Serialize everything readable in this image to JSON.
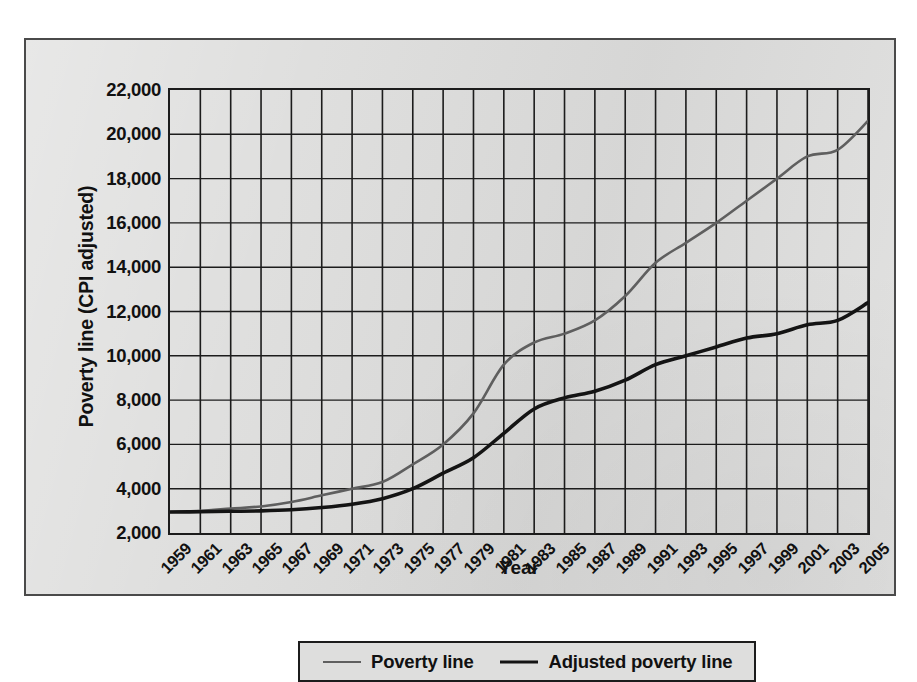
{
  "axes": {
    "ylabel": "Poverty line (CPI adjusted)",
    "xlabel": "Year"
  },
  "legend": {
    "items": [
      {
        "label": "Poverty line",
        "color": "#5f5f5f",
        "width": 2.0
      },
      {
        "label": "Adjusted poverty line",
        "color": "#141414",
        "width": 3.2
      }
    ]
  },
  "chart_data": {
    "type": "line",
    "title": "",
    "xlabel": "Year",
    "ylabel": "Poverty line (CPI adjusted)",
    "xlim": [
      1959,
      2005
    ],
    "ylim": [
      2000,
      22000
    ],
    "ytick_labels": [
      "2,000",
      "4,000",
      "6,000",
      "8,000",
      "10,000",
      "12,000",
      "14,000",
      "16,000",
      "18,000",
      "20,000",
      "22,000"
    ],
    "yticks": [
      2000,
      4000,
      6000,
      8000,
      10000,
      12000,
      14000,
      16000,
      18000,
      20000,
      22000
    ],
    "xtick_labels": [
      "1959",
      "1961",
      "1963",
      "1965",
      "1967",
      "1969",
      "1971",
      "1973",
      "1975",
      "1977",
      "1979",
      "1981",
      "1983",
      "1985",
      "1987",
      "1989",
      "1991",
      "1993",
      "1995",
      "1997",
      "1999",
      "2001",
      "2003",
      "2005"
    ],
    "xticks": [
      1959,
      1961,
      1963,
      1965,
      1967,
      1969,
      1971,
      1973,
      1975,
      1977,
      1979,
      1981,
      1983,
      1985,
      1987,
      1989,
      1991,
      1993,
      1995,
      1997,
      1999,
      2001,
      2003,
      2005
    ],
    "grid": true,
    "legend_position": "below",
    "x": [
      1959,
      1961,
      1963,
      1965,
      1967,
      1969,
      1971,
      1973,
      1975,
      1977,
      1979,
      1981,
      1983,
      1985,
      1987,
      1989,
      1991,
      1993,
      1995,
      1997,
      1999,
      2001,
      2003,
      2005
    ],
    "series": [
      {
        "name": "Poverty line",
        "color": "#5f5f5f",
        "values": [
          2950,
          3000,
          3100,
          3200,
          3400,
          3700,
          4000,
          4300,
          5100,
          6000,
          7400,
          9600,
          10600,
          11000,
          11600,
          12700,
          14200,
          15100,
          16000,
          17000,
          18000,
          19000,
          19300,
          20600
        ]
      },
      {
        "name": "Adjusted poverty line",
        "color": "#141414",
        "values": [
          2950,
          2960,
          2980,
          3000,
          3050,
          3150,
          3300,
          3550,
          4000,
          4700,
          5400,
          6500,
          7600,
          8100,
          8400,
          8900,
          9600,
          10000,
          10400,
          10800,
          11000,
          11400,
          11600,
          12400
        ]
      }
    ]
  }
}
